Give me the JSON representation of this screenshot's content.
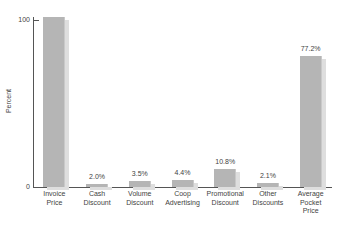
{
  "chart_data": {
    "type": "bar",
    "title": "",
    "subtitle": "",
    "xlabel": "",
    "ylabel": "Percent",
    "ylim": [
      0,
      100
    ],
    "grid": false,
    "legend": null,
    "y_ticks": [
      "0",
      "100"
    ],
    "categories": [
      "Invoice\nPrice",
      "Cash\nDiscount",
      "Volume\nDiscount",
      "Coop\nAdvertising",
      "Promotional\nDiscount",
      "Other\nDiscounts",
      "Average\nPocket\nPrice"
    ],
    "values": [
      100,
      2.0,
      3.5,
      4.4,
      10.8,
      2.1,
      77.2
    ],
    "data_labels": [
      "",
      "2.0%",
      "3.5%",
      "4.4%",
      "10.8%",
      "2.1%",
      "77.2%"
    ],
    "colors": {
      "bar": "#b5b5b5",
      "bar_shadow": "#dedede",
      "axis": "#555555",
      "text": "#3f3f3f",
      "background": "#ffffff"
    }
  },
  "axes": {
    "y_title": "Percent",
    "y_tick_top": "100",
    "y_tick_bottom": "0"
  },
  "bars": [
    {
      "label_line1": "Invoice",
      "label_line2": "Price",
      "label_line3": "",
      "value_label": ""
    },
    {
      "label_line1": "Cash",
      "label_line2": "Discount",
      "label_line3": "",
      "value_label": "2.0%"
    },
    {
      "label_line1": "Volume",
      "label_line2": "Discount",
      "label_line3": "",
      "value_label": "3.5%"
    },
    {
      "label_line1": "Coop",
      "label_line2": "Advertising",
      "label_line3": "",
      "value_label": "4.4%"
    },
    {
      "label_line1": "Promotional",
      "label_line2": "Discount",
      "label_line3": "",
      "value_label": "10.8%"
    },
    {
      "label_line1": "Other",
      "label_line2": "Discounts",
      "label_line3": "",
      "value_label": "2.1%"
    },
    {
      "label_line1": "Average",
      "label_line2": "Pocket",
      "label_line3": "Price",
      "value_label": "77.2%"
    }
  ]
}
